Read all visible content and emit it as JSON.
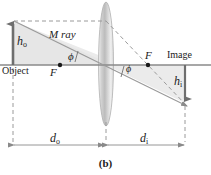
{
  "figure": {
    "caption": "(b)",
    "axis_label_object": "Object",
    "axis_label_image": "Image",
    "ray_label": "M ray",
    "object_height_symbol": "h",
    "object_height_subscript": "o",
    "image_height_symbol": "h",
    "image_height_subscript": "i",
    "object_distance_symbol": "d",
    "object_distance_subscript": "o",
    "image_distance_symbol": "d",
    "image_distance_subscript": "i",
    "focal_point_left_label": "F",
    "focal_point_right_label": "F",
    "angle_left_label": "ϕ",
    "angle_right_label": "ϕ"
  },
  "colors": {
    "axis": "#8a8a8a",
    "ray": "#9a9a9a",
    "dashed": "#9a9a9a",
    "arrow": "#6e6e6e",
    "shade": "#e9e9e9",
    "lens_edge": "#b3b3b3",
    "lens_fill_light": "#fafafa",
    "lens_fill_dark": "#c8c8c8",
    "text": "#1a1a1a",
    "background": "#ffffff"
  },
  "geometry": {
    "axis_y": 65,
    "object_x": 13,
    "object_top_y": 21,
    "lens_center_x": 106,
    "lens_top_y": 2,
    "lens_bottom_y": 126,
    "lens_half_width": 7,
    "focal_left_x": 60,
    "focal_right_x": 148,
    "image_x": 185,
    "image_bottom_y": 103,
    "dimension_line_y": 145
  }
}
